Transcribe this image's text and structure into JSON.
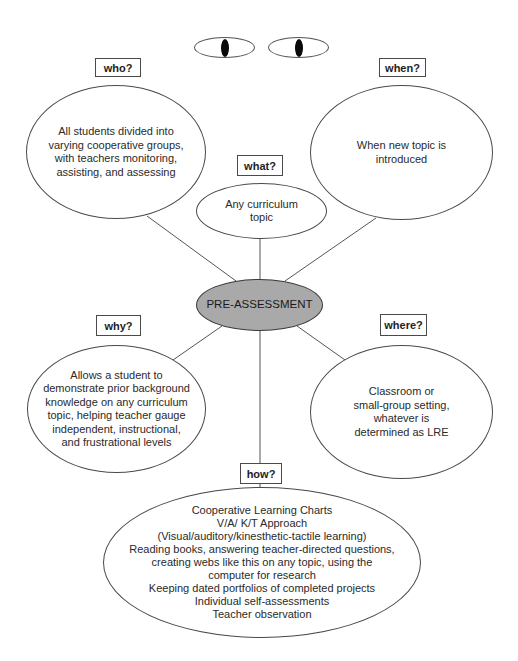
{
  "diagram": {
    "central": {
      "label": "PRE-ASSESSMENT",
      "fill": "#a9a9a9"
    },
    "decoration": {
      "eyes": "eyes-icon"
    },
    "branches": {
      "who": {
        "question": "who?",
        "lines": [
          "All students divided into",
          "varying cooperative groups,",
          "with teachers monitoring,",
          "assisting, and assessing"
        ]
      },
      "when": {
        "question": "when?",
        "lines": [
          "When new topic is",
          "introduced"
        ]
      },
      "what": {
        "question": "what?",
        "lines": [
          "Any curriculum",
          "topic"
        ]
      },
      "why": {
        "question": "why?",
        "lines": [
          "Allows a student to",
          "demonstrate prior background",
          "knowledge on any curriculum",
          "topic, helping teacher gauge",
          "independent, instructional,",
          "and frustrational levels"
        ]
      },
      "where": {
        "question": "where?",
        "lines": [
          "Classroom or",
          "small-group setting,",
          "whatever is",
          "determined as LRE"
        ]
      },
      "how": {
        "question": "how?",
        "lines": [
          "Cooperative Learning Charts",
          "V/A/ K/T Approach",
          "(Visual/auditory/kinesthetic-tactile learning)",
          "Reading books, answering teacher-directed questions,",
          "creating webs like this on any topic, using the",
          "computer for research",
          "Keeping dated portfolios of completed projects",
          "Individual self-assessments",
          "Teacher observation"
        ]
      }
    }
  }
}
